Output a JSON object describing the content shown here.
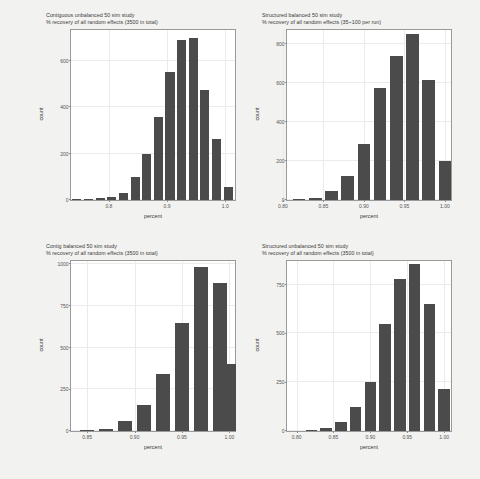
{
  "figure": {
    "background_color": "#f2f2f0",
    "bar_color": "#4b4b4b",
    "panel_background": "#ffffff",
    "grid_color": "#eceaea"
  },
  "chart_data": [
    {
      "type": "bar",
      "panel": "top-left",
      "title": "Contiguous unbalanced 50 sim study\n% recovery of all random effects (3500 in total)",
      "title_line1": "Contiguous unbalanced 50 sim study",
      "title_line2": "% recovery of all random effects (3500 in total)",
      "xlabel": "percent",
      "ylabel": "count",
      "xlim": [
        0.735,
        1.02
      ],
      "ylim": [
        0,
        740
      ],
      "grid": true,
      "xticks": [
        0.8,
        0.9,
        1.0
      ],
      "xticklabels": [
        "0.8",
        "0.9",
        "1.0"
      ],
      "yticks": [
        0,
        200,
        400,
        600
      ],
      "yticklabels": [
        "0",
        "200",
        "400",
        "600"
      ],
      "x": [
        0.75,
        0.77,
        0.79,
        0.81,
        0.83,
        0.85,
        0.87,
        0.89,
        0.91,
        0.93,
        0.95,
        0.97,
        0.99
      ],
      "values": [
        2,
        3,
        8,
        12,
        30,
        100,
        200,
        360,
        550,
        690,
        700,
        475,
        265,
        55
      ],
      "categories": [
        "0.745",
        "0.765",
        "0.785",
        "0.805",
        "0.825",
        "0.845",
        "0.865",
        "0.885",
        "0.905",
        "0.925",
        "0.945",
        "0.965",
        "0.985",
        "1.005"
      ]
    },
    {
      "type": "bar",
      "panel": "top-right",
      "title": "Structured balanced 50 sim study\n% recovery of all random effects (35~100 per run)",
      "title_line1": "Structured balanced 50 sim study",
      "title_line2": "% recovery of all random effects (35~100 per run)",
      "xlabel": "percent",
      "ylabel": "count",
      "xlim": [
        0.805,
        1.01
      ],
      "ylim": [
        0,
        880
      ],
      "grid": true,
      "xticks": [
        0.8,
        0.85,
        0.9,
        0.95,
        1.0
      ],
      "xticklabels": [
        "0.80",
        "0.85",
        "0.90",
        "0.95",
        "1.00"
      ],
      "yticks": [
        0,
        200,
        400,
        600,
        800
      ],
      "yticklabels": [
        "0",
        "200",
        "400",
        "600",
        "800"
      ],
      "categories": [
        "0.82",
        "0.84",
        "0.86",
        "0.88",
        "0.90",
        "0.92",
        "0.94",
        "0.96",
        "0.98",
        "1.00"
      ],
      "values": [
        5,
        10,
        45,
        125,
        290,
        575,
        740,
        850,
        615,
        200
      ]
    },
    {
      "type": "bar",
      "panel": "bottom-left",
      "title": "Contig balanced 50 sim study\n% recovery of all random effects (3500 in total)",
      "title_line1": "Contig balanced 50 sim study",
      "title_line2": "% recovery of all random effects (3500 in total)",
      "xlabel": "percent",
      "ylabel": "count",
      "xlim": [
        0.833,
        1.008
      ],
      "ylim": [
        0,
        1030
      ],
      "grid": true,
      "xticks": [
        0.85,
        0.9,
        0.95,
        1.0
      ],
      "xticklabels": [
        "0.85",
        "0.90",
        "0.95",
        "1.00"
      ],
      "yticks": [
        0,
        250,
        500,
        750,
        1000
      ],
      "yticklabels": [
        "0",
        "250",
        "500",
        "750",
        "1000"
      ],
      "categories": [
        "0.85",
        "0.87",
        "0.89",
        "0.91",
        "0.93",
        "0.95",
        "0.97",
        "0.99",
        "1.00"
      ],
      "values": [
        8,
        15,
        60,
        155,
        340,
        650,
        985,
        890,
        400
      ]
    },
    {
      "type": "bar",
      "panel": "bottom-right",
      "title": "Structured unbalanced 50 sim study\n% recovery of all random effects (3500 in total)",
      "title_line1": "Structured unbalanced 50 sim study",
      "title_line2": "% recovery of all random effects (3500 in total)",
      "xlabel": "percent",
      "ylabel": "count",
      "xlim": [
        0.787,
        1.012
      ],
      "ylim": [
        0,
        880
      ],
      "grid": true,
      "xticks": [
        0.8,
        0.85,
        0.9,
        0.95,
        1.0
      ],
      "xticklabels": [
        "0.80",
        "0.85",
        "0.90",
        "0.95",
        "1.00"
      ],
      "yticks": [
        0,
        250,
        500,
        750
      ],
      "yticklabels": [
        "0",
        "250",
        "500",
        "750"
      ],
      "categories": [
        "0.82",
        "0.84",
        "0.86",
        "0.88",
        "0.90",
        "0.92",
        "0.94",
        "0.96",
        "0.98",
        "1.00"
      ],
      "values": [
        5,
        15,
        45,
        125,
        250,
        550,
        780,
        855,
        650,
        215
      ]
    }
  ]
}
